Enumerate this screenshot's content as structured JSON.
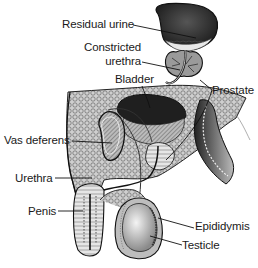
{
  "diagram": {
    "labels": {
      "residual_urine": "Residual urine",
      "constricted_urethra_line1": "Constricted",
      "constricted_urethra_line2": "urethra",
      "bladder": "Bladder",
      "prostate": "Prostate",
      "vas_deferens": "Vas deferens",
      "urethra": "Urethra",
      "penis": "Penis",
      "epididymis": "Epididymis",
      "testicle": "Testicle"
    },
    "colors": {
      "ink": "#1a1a1a",
      "dark_fill": "#2b2b2b",
      "mid_fill": "#8a8a8a",
      "light_fill": "#d6d6d6",
      "background": "#ffffff"
    }
  }
}
